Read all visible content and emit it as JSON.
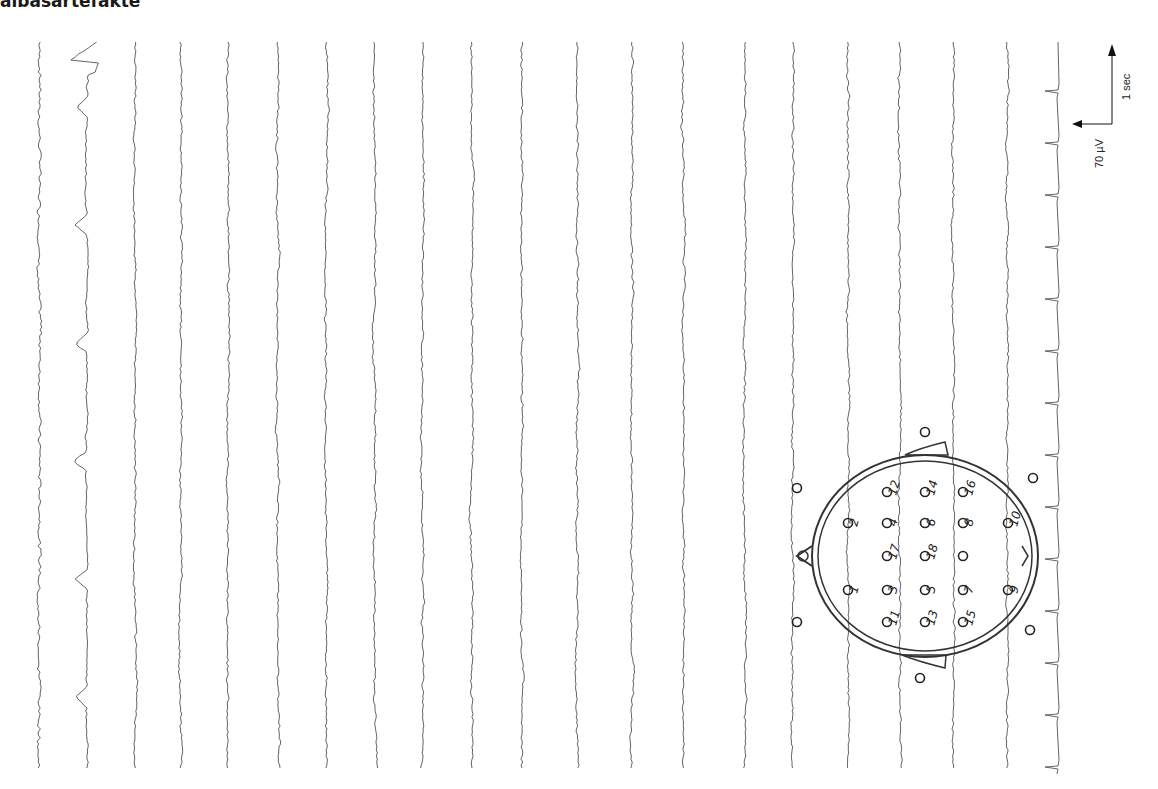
{
  "title": "albasartefakte",
  "figure": {
    "kind": "EEG recording with electrode head diagram",
    "orientation": "rotated 90 degrees (time runs top to bottom)",
    "eeg_channels": 20,
    "ecg_channel": true,
    "trace_color": "#555555"
  },
  "scale_bar": {
    "amplitude_label": "70 µV",
    "time_label": "1 sec"
  },
  "head_diagram": {
    "electrodes": [
      {
        "label": "1",
        "x": 848,
        "y": 590
      },
      {
        "label": "2",
        "x": 848,
        "y": 523
      },
      {
        "label": "3",
        "x": 887,
        "y": 590
      },
      {
        "label": "4",
        "x": 887,
        "y": 523
      },
      {
        "label": "5",
        "x": 925,
        "y": 590
      },
      {
        "label": "6",
        "x": 925,
        "y": 523
      },
      {
        "label": "7",
        "x": 963,
        "y": 590
      },
      {
        "label": "8",
        "x": 963,
        "y": 523
      },
      {
        "label": "9",
        "x": 1008,
        "y": 590
      },
      {
        "label": "10",
        "x": 1008,
        "y": 523
      },
      {
        "label": "11",
        "x": 887,
        "y": 622
      },
      {
        "label": "12",
        "x": 887,
        "y": 492
      },
      {
        "label": "13",
        "x": 925,
        "y": 622
      },
      {
        "label": "14",
        "x": 925,
        "y": 492
      },
      {
        "label": "15",
        "x": 963,
        "y": 622
      },
      {
        "label": "16",
        "x": 963,
        "y": 492
      },
      {
        "label": "17",
        "x": 887,
        "y": 556
      },
      {
        "label": "18",
        "x": 925,
        "y": 556
      },
      {
        "label": "",
        "x": 963,
        "y": 556
      }
    ],
    "outer_electrodes": [
      {
        "x": 797,
        "y": 488
      },
      {
        "x": 797,
        "y": 622
      },
      {
        "x": 925,
        "y": 432
      },
      {
        "x": 1033,
        "y": 478
      },
      {
        "x": 1030,
        "y": 630
      },
      {
        "x": 920,
        "y": 678
      }
    ]
  }
}
